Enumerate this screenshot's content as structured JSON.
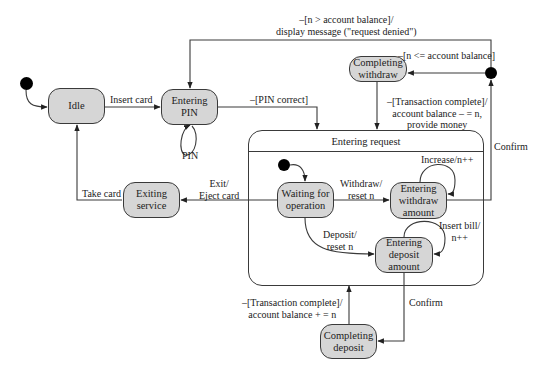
{
  "diagram": {
    "type": "UML state machine",
    "colors": {
      "state_fill": "#d6d6d6",
      "stroke": "#3a3a3a",
      "text": "#222222",
      "background": "#ffffff"
    },
    "states": {
      "idle": {
        "label": "Idle"
      },
      "entering_pin": {
        "label": "Entering\nPIN"
      },
      "completing_withdraw": {
        "label": "Completing\nwithdraw"
      },
      "exiting_service": {
        "label": "Exiting\nservice"
      },
      "waiting_for_operation": {
        "label": "Waiting for\noperation"
      },
      "entering_withdraw_amount": {
        "label": "Entering\nwithdraw\namount"
      },
      "entering_deposit_amount": {
        "label": "Entering\ndeposit\namount"
      },
      "completing_deposit": {
        "label": "Completing\ndeposit"
      }
    },
    "composite": {
      "title": "Entering request"
    },
    "transitions": {
      "insert_card": "Insert card",
      "pin_loop": "PIN",
      "pin_correct": "–[PIN correct]",
      "denied": "–[n > account balance]/\ndisplay message (\"request denied\")",
      "balance_ok": "–[n <= account balance]",
      "withdraw_complete": "–[Transaction complete]/\naccount balance – = n,\nprovide money",
      "confirm_withdraw": "Confirm",
      "increase": "Increase/n++",
      "withdraw_reset": "Withdraw/\nreset n",
      "exit_eject": "Exit/\nEject card",
      "take_card": "Take card",
      "deposit_reset": "Deposit/\nreset n",
      "insert_bill": "Insert bill/\nn++",
      "confirm_deposit": "Confirm",
      "deposit_complete": "–[Transaction complete]/\naccount balance + = n"
    }
  }
}
